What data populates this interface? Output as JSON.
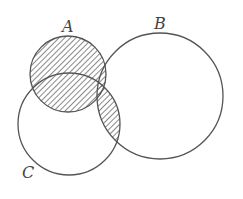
{
  "diagram": {
    "type": "venn",
    "sets": [
      {
        "name": "A",
        "label": "A",
        "cx": 68,
        "cy": 74,
        "r": 38,
        "label_x": 62,
        "label_y": 32
      },
      {
        "name": "B",
        "label": "B",
        "cx": 160,
        "cy": 96,
        "r": 63,
        "label_x": 154,
        "label_y": 29
      },
      {
        "name": "C",
        "label": "C",
        "cx": 69,
        "cy": 124,
        "r": 51,
        "label_x": 22,
        "label_y": 178
      }
    ],
    "shaded_regions": [
      "A",
      "B ∩ C"
    ],
    "stroke_color": "#555555",
    "hatch_color": "#555555"
  }
}
